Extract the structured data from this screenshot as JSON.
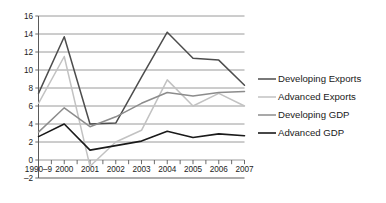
{
  "chart_data": {
    "type": "line",
    "title": "",
    "xlabel": "",
    "ylabel": "",
    "categories": [
      "1990–9",
      "2000",
      "2001",
      "2002",
      "2003",
      "2004",
      "2005",
      "2006",
      "2007"
    ],
    "ylim": [
      -2,
      16
    ],
    "ytick_values": [
      -2,
      0,
      2,
      4,
      6,
      8,
      10,
      12,
      14,
      16
    ],
    "ytick_labels": [
      "–2",
      "0",
      "2",
      "4",
      "6",
      "8",
      "10",
      "12",
      "14",
      "16"
    ],
    "grid": true,
    "legend_position": "right",
    "series": [
      {
        "name": "Developing Exports",
        "color": "#4d4d4d",
        "width": 1.5,
        "values": [
          7.4,
          13.7,
          4.0,
          4.1,
          9.2,
          14.2,
          11.3,
          11.1,
          8.3
        ]
      },
      {
        "name": "Advanced Exports",
        "color": "#c2c2c2",
        "width": 1.5,
        "values": [
          6.3,
          11.5,
          -0.7,
          2.0,
          3.3,
          8.9,
          6.0,
          7.4,
          6.0
        ]
      },
      {
        "name": "Developing GDP",
        "color": "#8c8c8c",
        "width": 1.5,
        "values": [
          3.1,
          5.8,
          3.7,
          4.8,
          6.3,
          7.5,
          7.1,
          7.5,
          7.6
        ]
      },
      {
        "name": "Advanced GDP",
        "color": "#1a1a1a",
        "width": 1.6,
        "values": [
          2.6,
          4.0,
          1.1,
          1.6,
          2.1,
          3.2,
          2.5,
          2.9,
          2.7
        ]
      }
    ]
  },
  "legend": {
    "items": [
      {
        "label": "Developing Exports",
        "swatch": "legend-swatch-developing-exports"
      },
      {
        "label": "Advanced Exports",
        "swatch": "legend-swatch-advanced-exports"
      },
      {
        "label": "Developing GDP",
        "swatch": "legend-swatch-developing-gdp"
      },
      {
        "label": "Advanced GDP",
        "swatch": "legend-swatch-advanced-gdp"
      }
    ]
  }
}
